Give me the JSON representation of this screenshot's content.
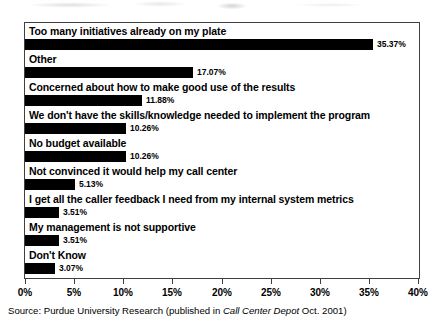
{
  "chart_data": {
    "type": "bar",
    "orientation": "horizontal",
    "title": "",
    "xlabel": "",
    "ylabel": "",
    "xlim": [
      0,
      40
    ],
    "xticks": [
      "0%",
      "5%",
      "10%",
      "15%",
      "20%",
      "25%",
      "30%",
      "35%",
      "40%"
    ],
    "xtick_values": [
      0,
      5,
      10,
      15,
      20,
      25,
      30,
      35,
      40
    ],
    "grid": false,
    "legend": null,
    "bar_color": "#000000",
    "categories": [
      "Too many initiatives already on my plate",
      "Other",
      "Concerned about how to make good use of the results",
      "We don't have the skills/knowledge needed to implement the program",
      "No budget available",
      "Not convinced it would help my call center",
      "I get all the caller feedback I need from my internal system metrics",
      "My management is not supportive",
      "Don't Know"
    ],
    "values": [
      35.37,
      17.07,
      11.88,
      10.26,
      10.26,
      5.13,
      3.51,
      3.51,
      3.07
    ],
    "value_labels": [
      "35.37%",
      "17.07%",
      "11.88%",
      "10.26%",
      "10.26%",
      "5.13%",
      "3.51%",
      "3.51%",
      "3.07%"
    ]
  },
  "source": {
    "prefix": "Source: Purdue University Research (published in ",
    "publication": "Call Center Depot",
    "suffix": " Oct. 2001)"
  }
}
